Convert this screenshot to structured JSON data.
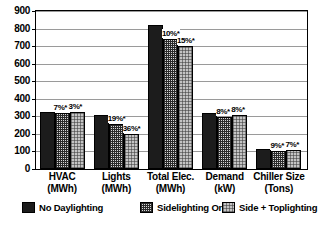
{
  "chart_data": {
    "type": "bar",
    "title": "",
    "xlabel": "",
    "ylabel": "",
    "ylim": [
      0,
      900
    ],
    "ytick_step": 100,
    "yticks": [
      "900",
      "800",
      "700",
      "600",
      "500",
      "400",
      "300",
      "200",
      "100",
      "0"
    ],
    "grid": true,
    "legend_position": "bottom",
    "categories": [
      {
        "line1": "HVAC",
        "line2": "(MWh)"
      },
      {
        "line1": "Lights",
        "line2": "(MWh)"
      },
      {
        "line1": "Total Elec.",
        "line2": "(MWh)"
      },
      {
        "line1": "Demand",
        "line2": "(kW)"
      },
      {
        "line1": "Chiller Size",
        "line2": "(Tons)"
      }
    ],
    "series": [
      {
        "name": "No Daylighting",
        "pattern": "solid-black",
        "color": "#1c1c1c",
        "values": [
          325,
          310,
          820,
          320,
          115
        ],
        "annotations": [
          "",
          "",
          "",
          "",
          ""
        ]
      },
      {
        "name": "Sidelighting Only",
        "pattern": "crosshatch",
        "color": "#d8d8d8",
        "values": [
          318,
          255,
          740,
          296,
          105
        ],
        "annotations": [
          "7%*",
          "19%*",
          "10%*",
          "8%*",
          "9%*"
        ]
      },
      {
        "name": "Side + Toplighting",
        "pattern": "fine-dots",
        "color": "#c4c4c4",
        "values": [
          322,
          200,
          700,
          305,
          107
        ],
        "annotations": [
          "3%*",
          "36%*",
          "15%*",
          "8%*",
          "7%*"
        ]
      }
    ]
  }
}
